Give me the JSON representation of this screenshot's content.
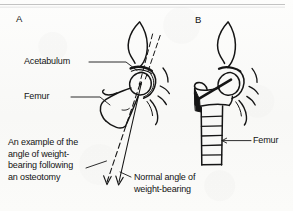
{
  "figure": {
    "background_color": "#fbfbfa",
    "ink_color": "#1a1a1a",
    "rule_color": "#c9c9c9",
    "width": 293,
    "height": 211
  },
  "panels": {
    "a": {
      "letter": "A",
      "description": "Line drawing of a hip joint showing pelvis, acetabulum and proximal femur with two weight-bearing angle lines",
      "labels": {
        "acetabulum": "Acetabulum",
        "femur": "Femur",
        "osteotomy_caption": "An example of the\nangle of weight-\nbearing following\nan osteotomy",
        "normal_caption": "Normal angle of\nweight-bearing"
      }
    },
    "b": {
      "letter": "B",
      "description": "Line drawing of the same hip after osteotomy with a fixation plate and screws in the femur",
      "labels": {
        "femur": "Femur"
      }
    }
  }
}
